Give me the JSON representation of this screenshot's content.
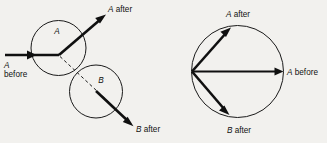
{
  "figure": {
    "background_color": "#f2f1ee",
    "ink_color": "#101010",
    "width": 327,
    "height": 143
  },
  "left_diagram": {
    "name": "two-ball-collision-geometry",
    "circles": [
      {
        "id": "A",
        "label": "A",
        "cx": 58.5,
        "cy": 48.0,
        "r": 27.5
      },
      {
        "id": "B",
        "label": "B",
        "cx": 96.0,
        "cy": 91.5,
        "r": 26.5
      }
    ],
    "vectors": [
      {
        "id": "a-before",
        "label_line1": "A",
        "label_line2": "before",
        "x1": 4,
        "y1": 55,
        "x2": 59,
        "y2": 55
      },
      {
        "id": "a-after",
        "label_line1": "A after",
        "label_line2": "",
        "x1": 59,
        "y1": 55,
        "x2": 107,
        "y2": 14
      },
      {
        "id": "b-after",
        "label_line1": "B after",
        "label_line2": "",
        "x1": 96,
        "y1": 91,
        "x2": 134,
        "y2": 127
      }
    ],
    "dashed_line": {
      "id": "line-of-centers",
      "x1": 59,
      "y1": 55,
      "x2": 97,
      "y2": 91
    },
    "labels": {
      "circle_a": "A",
      "circle_b": "B",
      "a_before_italic": "A",
      "a_before_rest": "before",
      "a_after_italic": "A",
      "a_after_rest": " after",
      "b_after_italic": "B",
      "b_after_rest": " after"
    }
  },
  "right_diagram": {
    "name": "momentum-vector-circle",
    "circle": {
      "id": "momentum-circle",
      "cx": 237.5,
      "cy": 71.5,
      "r": 46.0
    },
    "origin": {
      "x": 192.0,
      "y": 71.5
    },
    "vectors": [
      {
        "id": "a-before",
        "angle_deg": 0,
        "x2": 281,
        "y2": 71.5
      },
      {
        "id": "a-after",
        "angle_deg": 46,
        "x2": 224,
        "y2": 29
      },
      {
        "id": "b-after",
        "angle_deg": -44,
        "x2": 222,
        "y2": 116
      }
    ],
    "labels": {
      "a_before_italic": "A",
      "a_before_rest": " before",
      "a_after_italic": "A",
      "a_after_rest": " after",
      "b_after_italic": "B",
      "b_after_rest": " after"
    }
  }
}
